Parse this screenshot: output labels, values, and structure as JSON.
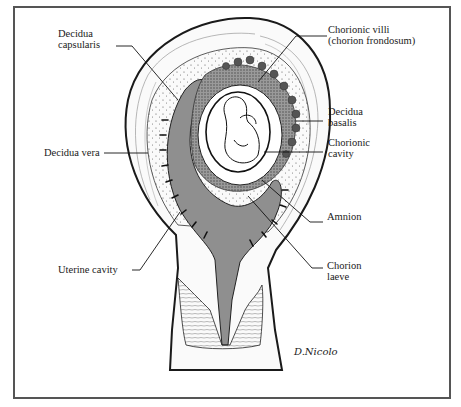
{
  "figure": {
    "signature": "D.Nicolo",
    "colors": {
      "line": "#1a1a1a",
      "cavity_shade": "#8c8c8c",
      "villi_shade": "#5a5a5a",
      "frame": "#555555",
      "background": "#ffffff"
    }
  },
  "labels": {
    "decidua_capsularis": [
      "Decidua",
      "capsularis"
    ],
    "decidua_vera": "Decidua vera",
    "uterine_cavity": "Uterine cavity",
    "chorionic_villi": [
      "Chorionic villi",
      "(chorion frondosum)"
    ],
    "decidua_basalis": [
      "Decidua",
      "basalis"
    ],
    "chorionic_cavity": [
      "Chorionic",
      "cavity"
    ],
    "amnion": "Amnion",
    "chorion_laeve": [
      "Chorion",
      "laeve"
    ]
  }
}
